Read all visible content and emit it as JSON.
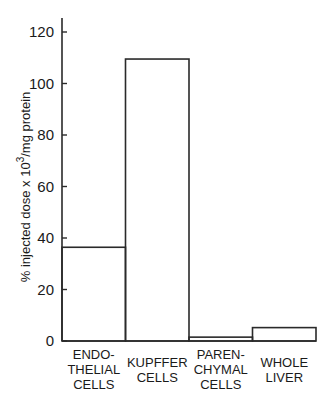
{
  "chart_data": {
    "type": "bar",
    "title": "",
    "xlabel": "",
    "ylabel": "% injected dose x 10^3/mg protein",
    "ylabel_parts": {
      "main": "% injected dose x 10",
      "sup": "3",
      "tail": "/mg protein"
    },
    "ylim": [
      0,
      120
    ],
    "yticks": [
      0,
      20,
      40,
      60,
      80,
      100,
      120
    ],
    "grid": false,
    "categories": [
      [
        "ENDO-",
        "THELIAL",
        "CELLS"
      ],
      [
        "KUPFFER",
        "CELLS"
      ],
      [
        "PAREN-",
        "CHYMAL",
        "CELLS"
      ],
      [
        "WHOLE",
        "LIVER"
      ]
    ],
    "values": [
      36.4,
      109.5,
      1.5,
      5.2
    ]
  }
}
